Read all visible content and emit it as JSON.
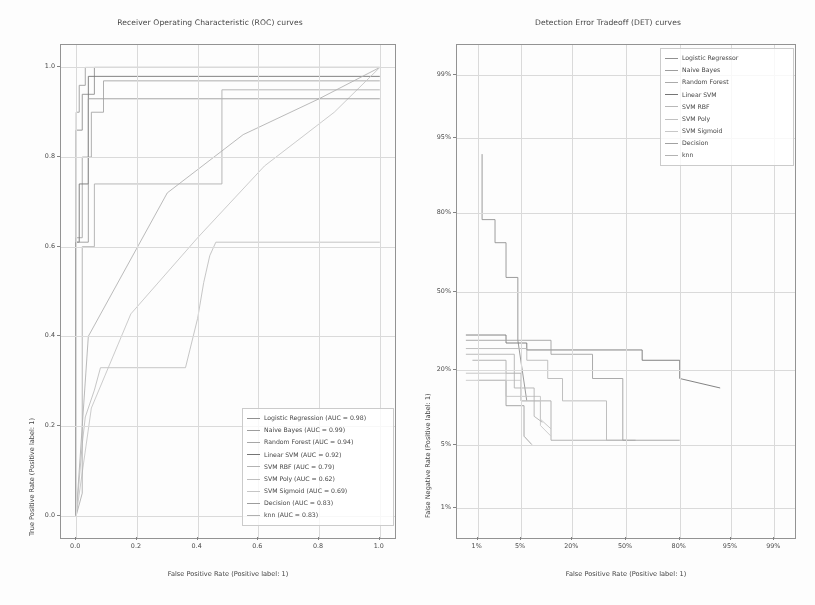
{
  "figure": {
    "width": 815,
    "height": 605,
    "background": "#ffffff"
  },
  "chart_data": [
    {
      "id": "roc",
      "type": "line",
      "title": "Receiver Operating Characteristic (ROC) curves",
      "xlabel": "False Positive Rate (Positive label: 1)",
      "ylabel": "True Positive Rate (Positive label: 1)",
      "xlim": [
        0.0,
        1.0
      ],
      "ylim": [
        0.0,
        1.0
      ],
      "xticks": [
        "0.0",
        "0.2",
        "0.4",
        "0.6",
        "0.8",
        "1.0"
      ],
      "xtickvals": [
        0.0,
        0.2,
        0.4,
        0.6,
        0.8,
        1.0
      ],
      "yticks": [
        "0.0",
        "0.2",
        "0.4",
        "0.6",
        "0.8",
        "1.0"
      ],
      "ytickvals": [
        0.0,
        0.2,
        0.4,
        0.6,
        0.8,
        1.0
      ],
      "grid": true,
      "legend_position": "lower right",
      "series": [
        {
          "name": "Logistic Regression",
          "label": "Logistic Regression (AUC = 0.98)",
          "auc": 0.98,
          "color": "#8c8c8c",
          "x": [
            0.0,
            0.0,
            0.02,
            0.02,
            0.06,
            0.06,
            1.0
          ],
          "y": [
            0.0,
            0.86,
            0.86,
            0.94,
            0.94,
            1.0,
            1.0
          ]
        },
        {
          "name": "Naive Bayes",
          "label": "Naive Bayes (AUC = 0.99)",
          "auc": 0.99,
          "color": "#9a9a9a",
          "x": [
            0.0,
            0.0,
            0.01,
            0.01,
            0.03,
            0.03,
            1.0
          ],
          "y": [
            0.0,
            0.9,
            0.9,
            0.96,
            0.96,
            1.0,
            1.0
          ]
        },
        {
          "name": "Random Forest",
          "label": "Random Forest (AUC = 0.94)",
          "auc": 0.94,
          "color": "#a3a3a3",
          "x": [
            0.0,
            0.0,
            0.02,
            0.02,
            0.05,
            0.05,
            0.09,
            0.09,
            1.0
          ],
          "y": [
            0.0,
            0.62,
            0.62,
            0.8,
            0.8,
            0.9,
            0.9,
            0.97,
            0.97
          ]
        },
        {
          "name": "Linear SVM",
          "label": "Linear SVM (AUC = 0.92)",
          "auc": 0.92,
          "color": "#6f6f6f",
          "x": [
            0.0,
            0.0,
            0.01,
            0.01,
            0.04,
            0.04,
            1.0
          ],
          "y": [
            0.0,
            0.61,
            0.61,
            0.74,
            0.74,
            0.98,
            0.98
          ]
        },
        {
          "name": "SVM RBF",
          "label": "SVM RBF (AUC = 0.79)",
          "auc": 0.79,
          "color": "#b0b0b0",
          "x": [
            0.0,
            0.02,
            0.04,
            0.3,
            0.55,
            0.8,
            1.0
          ],
          "y": [
            0.0,
            0.2,
            0.4,
            0.72,
            0.85,
            0.93,
            1.0
          ]
        },
        {
          "name": "SVM Poly",
          "label": "SVM Poly (AUC = 0.62)",
          "auc": 0.62,
          "color": "#bdbdbd",
          "x": [
            0.0,
            0.02,
            0.03,
            0.06,
            0.08,
            0.36,
            0.4,
            0.42,
            0.44,
            0.46,
            1.0
          ],
          "y": [
            0.0,
            0.16,
            0.22,
            0.28,
            0.33,
            0.33,
            0.44,
            0.52,
            0.58,
            0.61,
            0.61
          ]
        },
        {
          "name": "SVM Sigmoid",
          "label": "SVM Sigmoid (AUC = 0.69)",
          "auc": 0.69,
          "color": "#c4c4c4",
          "x": [
            0.0,
            0.05,
            0.18,
            0.4,
            0.62,
            0.85,
            1.0
          ],
          "y": [
            0.0,
            0.24,
            0.45,
            0.62,
            0.78,
            0.9,
            1.0
          ]
        },
        {
          "name": "Decision",
          "label": "Decision (AUC = 0.83)",
          "auc": 0.83,
          "color": "#999999",
          "x": [
            0.0,
            0.0,
            0.04,
            0.04,
            1.0
          ],
          "y": [
            0.0,
            0.61,
            0.61,
            0.93,
            0.93
          ]
        },
        {
          "name": "knn",
          "label": "knn (AUC = 0.83)",
          "auc": 0.83,
          "color": "#adadad",
          "x": [
            0.0,
            0.02,
            0.02,
            0.06,
            0.06,
            0.48,
            0.48,
            1.0
          ],
          "y": [
            0.0,
            0.05,
            0.6,
            0.6,
            0.74,
            0.74,
            0.95,
            0.95
          ]
        }
      ]
    },
    {
      "id": "det",
      "type": "line",
      "title": "Detection Error Tradeoff (DET) curves",
      "xlabel": "False Positive Rate (Positive label: 1)",
      "ylabel": "False Negative Rate (Positive label: 1)",
      "xticks": [
        "1%",
        "5%",
        "20%",
        "50%",
        "80%",
        "95%",
        "99%"
      ],
      "xtickvals": [
        0.01,
        0.05,
        0.2,
        0.5,
        0.8,
        0.95,
        0.99
      ],
      "yticks": [
        "99%",
        "95%",
        "80%",
        "50%",
        "20%",
        "5%",
        "1%"
      ],
      "ytickvals": [
        0.99,
        0.95,
        0.8,
        0.5,
        0.2,
        0.05,
        0.01
      ],
      "scale": "probit",
      "grid": true,
      "legend_position": "upper right",
      "series": [
        {
          "name": "Logistic Regressor",
          "label": "Logistic Regressor",
          "color": "#8c8c8c",
          "x": [
            0.012,
            0.012,
            0.02,
            0.02,
            0.03,
            0.03,
            0.045,
            0.045,
            0.06
          ],
          "y": [
            0.93,
            0.78,
            0.78,
            0.7,
            0.7,
            0.56,
            0.56,
            0.3,
            0.12
          ]
        },
        {
          "name": "Naive Bayes",
          "label": "Naive Bayes",
          "color": "#9a9a9a",
          "x": [
            0.01,
            0.03,
            0.03,
            0.055,
            0.055,
            0.07
          ],
          "y": [
            0.17,
            0.17,
            0.11,
            0.11,
            0.06,
            0.05
          ]
        },
        {
          "name": "Random Forest",
          "label": "Random Forest",
          "color": "#a8a8a8",
          "x": [
            0.008,
            0.03,
            0.03,
            0.05,
            0.05,
            0.12,
            0.12,
            0.5
          ],
          "y": [
            0.23,
            0.23,
            0.19,
            0.19,
            0.12,
            0.12,
            0.055,
            0.055
          ]
        },
        {
          "name": "Linear SVM",
          "label": "Linear SVM",
          "color": "#6f6f6f",
          "x": [
            0.006,
            0.03,
            0.03,
            0.06,
            0.06,
            0.6,
            0.6,
            0.8,
            0.8,
            0.93
          ],
          "y": [
            0.32,
            0.32,
            0.29,
            0.29,
            0.265,
            0.265,
            0.23,
            0.23,
            0.175,
            0.15
          ]
        },
        {
          "name": "SVM RBF",
          "label": "SVM RBF",
          "color": "#b5b5b5",
          "x": [
            0.006,
            0.06,
            0.06,
            0.11,
            0.11,
            0.16,
            0.16,
            0.38,
            0.38,
            0.56
          ],
          "y": [
            0.27,
            0.27,
            0.23,
            0.23,
            0.175,
            0.175,
            0.12,
            0.12,
            0.055,
            0.055
          ]
        },
        {
          "name": "SVM Poly",
          "label": "SVM Poly",
          "color": "#bfbfbf",
          "x": [
            0.006,
            0.03,
            0.03,
            0.09,
            0.09,
            0.12
          ],
          "y": [
            0.19,
            0.19,
            0.13,
            0.13,
            0.085,
            0.07
          ]
        },
        {
          "name": "SVM Sigmoid",
          "label": "SVM Sigmoid",
          "color": "#c6c6c6",
          "x": [
            0.006,
            0.05,
            0.05,
            0.09,
            0.09,
            0.12
          ],
          "y": [
            0.17,
            0.17,
            0.12,
            0.12,
            0.075,
            0.06
          ]
        },
        {
          "name": "Decision",
          "label": "Decision",
          "color": "#9e9e9e",
          "x": [
            0.006,
            0.12,
            0.12,
            0.3,
            0.3,
            0.48,
            0.48,
            0.8
          ],
          "y": [
            0.3,
            0.3,
            0.25,
            0.25,
            0.175,
            0.175,
            0.055,
            0.055
          ]
        },
        {
          "name": "knn",
          "label": "knn",
          "color": "#b0b0b0",
          "x": [
            0.006,
            0.04,
            0.04,
            0.075,
            0.075,
            0.095
          ],
          "y": [
            0.25,
            0.25,
            0.15,
            0.15,
            0.09,
            0.08
          ]
        }
      ]
    }
  ]
}
